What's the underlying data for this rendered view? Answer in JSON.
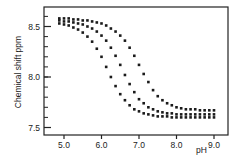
{
  "chart_data": {
    "type": "scatter",
    "title": "",
    "xlabel": "pH",
    "ylabel": "Chemical shift ppm",
    "xlim": [
      4.5,
      9.4
    ],
    "ylim": [
      7.42,
      8.68
    ],
    "xticks": [
      5.0,
      6.0,
      7.0,
      8.0,
      9.0
    ],
    "xtick_labels": [
      "5.0",
      "6.0",
      "7.0",
      "8.0",
      "9.0"
    ],
    "yticks": [
      7.5,
      8.0,
      8.5
    ],
    "ytick_labels": [
      "7.5",
      "8.0",
      "8.5"
    ],
    "y_minor_step": 0.1,
    "grid": false,
    "legend": null,
    "marker_color": "#1a1a1a",
    "x": [
      4.875,
      5.0,
      5.125,
      5.25,
      5.375,
      5.5,
      5.625,
      5.75,
      5.875,
      6.0,
      6.125,
      6.25,
      6.375,
      6.5,
      6.625,
      6.75,
      6.875,
      7.0,
      7.125,
      7.25,
      7.375,
      7.5,
      7.625,
      7.75,
      7.875,
      8.0,
      8.125,
      8.25,
      8.375,
      8.5,
      8.625,
      8.75,
      8.875,
      9.0
    ],
    "series": [
      {
        "name": "Series A",
        "values": [
          8.53,
          8.52,
          8.51,
          8.49,
          8.47,
          8.44,
          8.4,
          8.35,
          8.28,
          8.2,
          8.1,
          8.0,
          7.91,
          7.83,
          7.77,
          7.72,
          7.68,
          7.66,
          7.64,
          7.63,
          7.62,
          7.61,
          7.61,
          7.61,
          7.6,
          7.6,
          7.6,
          7.6,
          7.6,
          7.6,
          7.6,
          7.6,
          7.6,
          7.6
        ]
      },
      {
        "name": "Series B",
        "values": [
          8.56,
          8.55,
          8.55,
          8.54,
          8.53,
          8.52,
          8.5,
          8.48,
          8.45,
          8.41,
          8.36,
          8.29,
          8.21,
          8.12,
          8.02,
          7.93,
          7.85,
          7.78,
          7.74,
          7.7,
          7.68,
          7.66,
          7.65,
          7.64,
          7.64,
          7.63,
          7.63,
          7.63,
          7.63,
          7.63,
          7.63,
          7.63,
          7.63,
          7.63
        ]
      },
      {
        "name": "Series C",
        "values": [
          8.58,
          8.58,
          8.58,
          8.57,
          8.57,
          8.56,
          8.56,
          8.55,
          8.54,
          8.53,
          8.51,
          8.48,
          8.45,
          8.41,
          8.36,
          8.29,
          8.21,
          8.12,
          8.03,
          7.95,
          7.87,
          7.81,
          7.77,
          7.74,
          7.72,
          7.7,
          7.69,
          7.68,
          7.68,
          7.68,
          7.67,
          7.67,
          7.67,
          7.67
        ]
      }
    ]
  }
}
